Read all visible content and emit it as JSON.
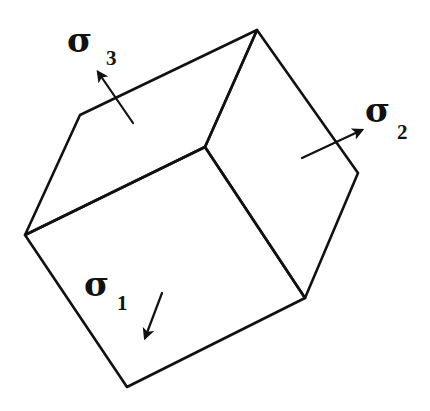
{
  "diagram": {
    "colors": {
      "line": "#111111",
      "background": "#ffffff"
    },
    "vertices": {
      "top": [
        257,
        30
      ],
      "top_left": [
        80,
        115
      ],
      "left": [
        25,
        235
      ],
      "inner": [
        205,
        147
      ],
      "right": [
        358,
        173
      ],
      "bottom_right": [
        305,
        298
      ],
      "bottom": [
        127,
        387
      ]
    },
    "labels": [
      {
        "id": "sigma3",
        "symbol": "σ",
        "subscript": "3",
        "face": "top"
      },
      {
        "id": "sigma2",
        "symbol": "σ",
        "subscript": "2",
        "face": "right"
      },
      {
        "id": "sigma1",
        "symbol": "σ",
        "subscript": "1",
        "face": "front"
      }
    ],
    "arrows": [
      {
        "id": "sigma3-arrow",
        "from": [
          133,
          123
        ],
        "to": [
          98,
          72
        ]
      },
      {
        "id": "sigma2-arrow",
        "from": [
          302,
          158
        ],
        "to": [
          362,
          130
        ]
      },
      {
        "id": "sigma1-arrow",
        "from": [
          162,
          293
        ],
        "to": [
          145,
          338
        ]
      }
    ]
  }
}
